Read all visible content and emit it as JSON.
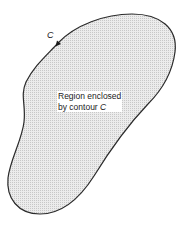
{
  "diagram": {
    "contour_label": "C",
    "region_label_line1": "Region enclosed",
    "region_label_line2_prefix": "by contour ",
    "region_label_line2_var": "C",
    "colors": {
      "stroke": "#2a2a2a",
      "fill": "#e4e4e4",
      "background": "#ffffff"
    },
    "icons": {
      "direction_arrow": "arrowhead-pointing-down-left"
    }
  }
}
